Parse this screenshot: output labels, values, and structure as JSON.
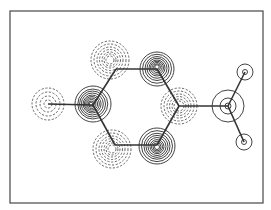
{
  "figure": {
    "type": "molecular orbital contour plot",
    "frame": {
      "x": 10,
      "y": 11,
      "width": 253,
      "height": 192,
      "stroke": "#555555"
    },
    "bond_color": "#333333",
    "positive_contour_color": "#444444",
    "negative_contour_color": "#555555",
    "ring_vertices": [
      {
        "id": "C1",
        "x": 93,
        "y": 105
      },
      {
        "id": "C2",
        "x": 116,
        "y": 69
      },
      {
        "id": "C3",
        "x": 157,
        "y": 69
      },
      {
        "id": "C4",
        "x": 179,
        "y": 106
      },
      {
        "id": "C5",
        "x": 157,
        "y": 145
      },
      {
        "id": "C6",
        "x": 115,
        "y": 145
      }
    ],
    "substituents": [
      {
        "id": "X_left",
        "x": 48,
        "y": 104
      },
      {
        "id": "C_right",
        "x": 228,
        "y": 106
      },
      {
        "id": "H_top",
        "x": 245,
        "y": 72
      },
      {
        "id": "H_bottom",
        "x": 244,
        "y": 142
      }
    ],
    "contour_groups": [
      {
        "center": [
          48,
          104
        ],
        "sign": "negative",
        "radii": [
          16,
          12,
          8,
          4
        ],
        "dx": 0,
        "dy": 0
      },
      {
        "center": [
          93,
          104
        ],
        "sign": "positive",
        "radii": [
          18,
          15,
          13,
          11,
          9,
          7.5,
          6,
          4.5,
          3,
          1.8
        ],
        "dx": -2,
        "dy": 0
      },
      {
        "center": [
          110,
          60
        ],
        "sign": "negative",
        "radii": [
          19,
          16,
          13,
          10.5,
          8,
          6,
          4
        ],
        "dx": 0,
        "dy": 0
      },
      {
        "center": [
          157,
          69
        ],
        "sign": "positive",
        "radii": [
          17,
          14.5,
          12,
          10,
          8,
          6.5,
          5,
          3.5,
          2.2
        ],
        "dx": 0,
        "dy": -2
      },
      {
        "center": [
          179,
          106
        ],
        "sign": "negative",
        "radii": [
          18,
          15,
          12,
          9.5,
          7,
          5
        ],
        "dx": 0,
        "dy": 0
      },
      {
        "center": [
          112,
          149
        ],
        "sign": "negative",
        "radii": [
          19,
          16,
          13,
          10.5,
          8,
          6,
          4
        ],
        "dx": 0,
        "dy": 0
      },
      {
        "center": [
          157,
          146
        ],
        "sign": "positive",
        "radii": [
          18,
          15.5,
          13,
          11,
          9,
          7,
          5.5,
          4,
          2.5
        ],
        "dx": 0,
        "dy": 1
      },
      {
        "center": [
          228,
          106
        ],
        "sign": "positive",
        "radii": [
          16,
          8,
          3
        ],
        "dx": 0,
        "dy": 0
      },
      {
        "center": [
          245,
          72
        ],
        "sign": "positive",
        "radii": [
          8,
          2.5
        ],
        "dx": 0,
        "dy": 0
      },
      {
        "center": [
          244,
          142
        ],
        "sign": "positive",
        "radii": [
          8,
          2.5
        ],
        "dx": 0,
        "dy": 0
      }
    ]
  }
}
